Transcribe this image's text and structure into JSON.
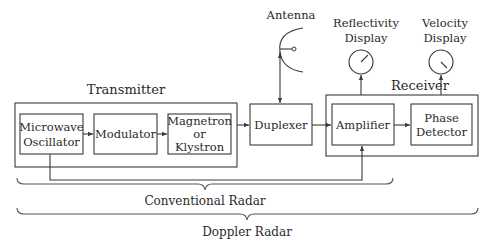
{
  "diagram": {
    "groups": {
      "transmitter": {
        "label": "Transmitter"
      },
      "receiver": {
        "label": "Receiver"
      }
    },
    "blocks": {
      "oscillator": {
        "line1": "Microwave",
        "line2": "Oscillator"
      },
      "modulator": {
        "label": "Modulator"
      },
      "magnetron": {
        "line1": "Magnetron",
        "line2": "or",
        "line3": "Klystron"
      },
      "duplexer": {
        "label": "Duplexer"
      },
      "amplifier": {
        "label": "Amplifier"
      },
      "phase_detector": {
        "line1": "Phase",
        "line2": "Detector"
      }
    },
    "peripherals": {
      "antenna": {
        "label": "Antenna"
      },
      "reflectivity_display": {
        "line1": "Reflectivity",
        "line2": "Display"
      },
      "velocity_display": {
        "line1": "Velocity",
        "line2": "Display"
      }
    },
    "braces": {
      "conventional": {
        "label": "Conventional Radar"
      },
      "doppler": {
        "label": "Doppler Radar"
      }
    },
    "colors": {
      "stroke": "#3a3a3a",
      "text": "#2a2a2a",
      "background": "#ffffff"
    }
  }
}
